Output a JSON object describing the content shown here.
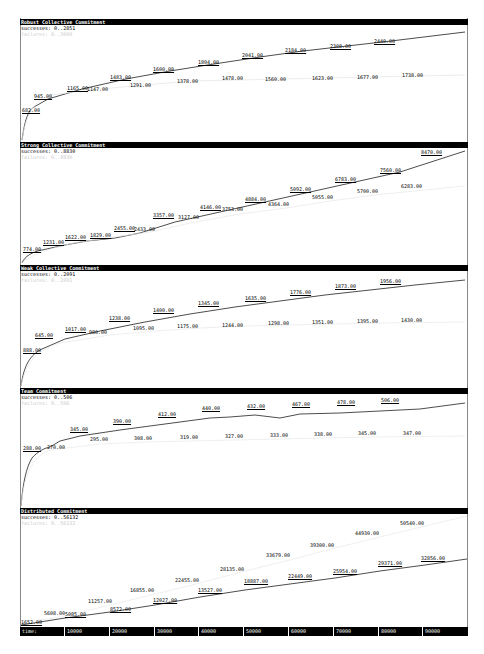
{
  "x_axis": {
    "label": "time:",
    "ticks": [
      "10000",
      "20000",
      "30000",
      "40000",
      "50000",
      "60000",
      "70000",
      "80000",
      "90000"
    ]
  },
  "panels": [
    {
      "title": "Robust Collective Commitment",
      "successes_label": "successes: 0..2851",
      "failures_label": "failures: 0..3000"
    },
    {
      "title": "Strong Collective Commitment",
      "successes_label": "successes: 0..8830",
      "failures_label": "failures: 0..8830"
    },
    {
      "title": "Weak Collective Commitment",
      "successes_label": "successes: 0..2091",
      "failures_label": "failures: 0..2091"
    },
    {
      "title": "Team Commitment",
      "successes_label": "successes: 0..506",
      "failures_label": "failures: 0..506"
    },
    {
      "title": "Distributed Commitment",
      "successes_label": "successes: 0..56132",
      "failures_label": "failures: 0..56132"
    }
  ],
  "chart_data": [
    {
      "type": "line",
      "title": "Robust Collective Commitment",
      "xlabel": "time",
      "ylim": [
        0,
        2851
      ],
      "x": [
        2000,
        6000,
        12000,
        14000,
        20000,
        30000,
        40000,
        50000,
        60000,
        70000,
        80000,
        90000
      ],
      "series": [
        {
          "name": "successes",
          "values_labeled": [
            "682.00",
            "945.00",
            "1165.00",
            "1483.00",
            "1600.00",
            "1804.00",
            "2041.00",
            "2184.00",
            "2308.00",
            "2440.00"
          ],
          "x": [
            2000,
            8000,
            14000,
            22000,
            36000,
            48000,
            57000,
            69000,
            81000,
            93000
          ],
          "values": [
            682,
            945,
            1165,
            1483,
            1600,
            1804,
            2041,
            2184,
            2308,
            2440
          ]
        },
        {
          "name": "failures",
          "x": [
            19000,
            30000,
            44000,
            57000,
            70000,
            83000,
            95000
          ],
          "values": [
            1147,
            1291,
            1378,
            1478,
            1560,
            1623,
            1677,
            1738
          ],
          "values_labeled": [
            "1147.00",
            "1291.00",
            "1378.00",
            "1478.00",
            "1560.00",
            "1623.00",
            "1677.00",
            "1738.00"
          ]
        }
      ]
    },
    {
      "type": "line",
      "title": "Strong Collective Commitment",
      "xlabel": "time",
      "ylim": [
        0,
        8830
      ],
      "series": [
        {
          "name": "successes",
          "values": [
            774,
            1231,
            1622,
            1829,
            2455,
            3357,
            4146,
            4884,
            5092,
            6783,
            7560,
            8470
          ],
          "values_labeled": [
            "774.00",
            "1231.00",
            "1622.00",
            "1829.00",
            "2455.00",
            "3357.00",
            "4146.00",
            "4884.00",
            "5092.00",
            "6783.00",
            "7560.00",
            "8470.00"
          ]
        },
        {
          "name": "failures",
          "values": [
            2433,
            3127,
            3753,
            4364,
            5055,
            5700,
            6283
          ],
          "values_labeled": [
            "2433.00",
            "3127.00",
            "3753.00",
            "4364.00",
            "5055.00",
            "5700.00",
            "6283.00"
          ]
        }
      ]
    },
    {
      "type": "line",
      "title": "Weak Collective Commitment",
      "xlabel": "time",
      "ylim": [
        0,
        2091
      ],
      "series": [
        {
          "name": "successes",
          "values": [
            888,
            645,
            1017,
            1238,
            1400,
            1345,
            1635,
            1776,
            1873,
            1956
          ],
          "values_labeled": [
            "888.00",
            "645.00",
            "1017.00",
            "1238.00",
            "1400.00",
            "1345.00",
            "1635.00",
            "1776.00",
            "1873.00",
            "1956.00"
          ]
        },
        {
          "name": "failures",
          "values": [
            980,
            1095,
            1175,
            1244,
            1298,
            1351,
            1395,
            1430
          ],
          "values_labeled": [
            "980.00",
            "1095.00",
            "1175.00",
            "1244.00",
            "1298.00",
            "1351.00",
            "1395.00",
            "1430.00"
          ]
        }
      ]
    },
    {
      "type": "line",
      "title": "Team Commitment",
      "xlabel": "time",
      "ylim": [
        0,
        506
      ],
      "series": [
        {
          "name": "successes",
          "values": [
            288,
            345,
            390,
            412,
            440,
            432,
            467,
            478,
            506
          ],
          "values_labeled": [
            "288.00",
            "345.00",
            "390.00",
            "412.00",
            "440.00",
            "432.00",
            "467.00",
            "478.00",
            "506.00"
          ]
        },
        {
          "name": "failures",
          "values": [
            270,
            295,
            308,
            319,
            327,
            333,
            338,
            345,
            347
          ],
          "values_labeled": [
            "270.00",
            "295.00",
            "308.00",
            "319.00",
            "327.00",
            "333.00",
            "338.00",
            "345.00",
            "347.00"
          ]
        }
      ]
    },
    {
      "type": "line",
      "title": "Distributed Commitment",
      "xlabel": "time",
      "ylim": [
        0,
        56132
      ],
      "x_ticks": [
        10000,
        20000,
        30000,
        40000,
        50000,
        60000,
        70000,
        80000,
        90000
      ],
      "series": [
        {
          "name": "successes",
          "values": [
            1652,
            5085,
            8572,
            12027,
            13527,
            18887,
            22449,
            25954,
            29371,
            32856
          ],
          "values_labeled": [
            "1652.00",
            "5085.00",
            "8572.00",
            "12027.00",
            "13527.00",
            "18887.00",
            "22449.00",
            "25954.00",
            "29371.00",
            "32856.00"
          ]
        },
        {
          "name": "failures",
          "values": [
            5608,
            11257,
            16855,
            22455,
            28135,
            33679,
            39300,
            44930,
            50540
          ],
          "values_labeled": [
            "5608.00",
            "11257.00",
            "16855.00",
            "22455.00",
            "28135.00",
            "33679.00",
            "39300.00",
            "44930.00",
            "50540.00"
          ]
        }
      ]
    }
  ],
  "labels": {
    "p0": {
      "s": [
        [
          "682.00",
          2,
          88
        ],
        [
          "945.00",
          14,
          74
        ],
        [
          "1165.00",
          47,
          66
        ],
        [
          "1483.00",
          90,
          55
        ],
        [
          "1600.00",
          133,
          47
        ],
        [
          "1804.00",
          178,
          40
        ],
        [
          "2041.00",
          222,
          33
        ],
        [
          "2184.00",
          265,
          28
        ],
        [
          "2308.00",
          310,
          24
        ],
        [
          "2440.00",
          354,
          19
        ]
      ],
      "f": [
        [
          "1147.00",
          67,
          67
        ],
        [
          "1291.00",
          110,
          63
        ],
        [
          "1378.00",
          157,
          59
        ],
        [
          "1478.00",
          202,
          56
        ],
        [
          "1560.00",
          245,
          57
        ],
        [
          "1623.00",
          292,
          56
        ],
        [
          "1677.00",
          337,
          55
        ],
        [
          "1738.00",
          382,
          53
        ]
      ]
    },
    "p1": {
      "s": [
        [
          "774.00",
          3,
          104
        ],
        [
          "1231.00",
          23,
          97
        ],
        [
          "1622.00",
          45,
          92
        ],
        [
          "1829.00",
          70,
          90
        ],
        [
          "2455.00",
          94,
          83
        ],
        [
          "3357.00",
          133,
          70
        ],
        [
          "4146.00",
          180,
          62
        ],
        [
          "4884.00",
          225,
          54
        ],
        [
          "5092.00",
          270,
          44
        ],
        [
          "6783.00",
          315,
          34
        ],
        [
          "7560.00",
          360,
          25
        ],
        [
          "8470.00",
          401,
          7
        ]
      ],
      "f": [
        [
          "2433.00",
          114,
          84
        ],
        [
          "3127.00",
          158,
          72
        ],
        [
          "3753.00",
          202,
          64
        ],
        [
          "4364.00",
          248,
          59
        ],
        [
          "5055.00",
          292,
          52
        ],
        [
          "5700.00",
          337,
          46
        ],
        [
          "6283.00",
          381,
          41
        ]
      ]
    },
    "p2": {
      "s": [
        [
          "888.00",
          3,
          82
        ],
        [
          "645.00",
          15,
          67
        ],
        [
          "1017.00",
          45,
          61
        ],
        [
          "1238.00",
          89,
          50
        ],
        [
          "1400.00",
          133,
          42
        ],
        [
          "1345.00",
          178,
          35
        ],
        [
          "1635.00",
          225,
          30
        ],
        [
          "1776.00",
          270,
          24
        ],
        [
          "1873.00",
          315,
          18
        ],
        [
          "1956.00",
          360,
          13
        ]
      ],
      "f": [
        [
          "980.00",
          69,
          64
        ],
        [
          "1095.00",
          113,
          60
        ],
        [
          "1175.00",
          157,
          58
        ],
        [
          "1244.00",
          202,
          57
        ],
        [
          "1298.00",
          248,
          55
        ],
        [
          "1351.00",
          292,
          54
        ],
        [
          "1395.00",
          337,
          53
        ],
        [
          "1430.00",
          381,
          52
        ]
      ]
    },
    "p3": {
      "s": [
        [
          "288.00",
          3,
          57
        ],
        [
          "345.00",
          50,
          38
        ],
        [
          "390.00",
          93,
          30
        ],
        [
          "412.00",
          138,
          23
        ],
        [
          "440.00",
          182,
          17
        ],
        [
          "432.00",
          227,
          15
        ],
        [
          "467.00",
          272,
          13
        ],
        [
          "478.00",
          317,
          11
        ],
        [
          "506.00",
          361,
          9
        ]
      ],
      "f": [
        [
          "270.00",
          27,
          56
        ],
        [
          "295.00",
          70,
          48
        ],
        [
          "308.00",
          114,
          47
        ],
        [
          "319.00",
          160,
          46
        ],
        [
          "327.00",
          205,
          45
        ],
        [
          "333.00",
          250,
          44
        ],
        [
          "338.00",
          294,
          43
        ],
        [
          "345.00",
          338,
          42
        ],
        [
          "347.00",
          383,
          42
        ]
      ]
    },
    "p4": {
      "s": [
        [
          "1652.00",
          1,
          111
        ],
        [
          "5085.00",
          45,
          103
        ],
        [
          "8572.00",
          90,
          98
        ],
        [
          "12027.00",
          133,
          89
        ],
        [
          "13527.00",
          178,
          79
        ],
        [
          "18887.00",
          224,
          70
        ],
        [
          "22449.00",
          268,
          65
        ],
        [
          "25954.00",
          313,
          60
        ],
        [
          "29371.00",
          358,
          52
        ],
        [
          "32856.00",
          401,
          47
        ]
      ],
      "f": [
        [
          "5608.00",
          24,
          102
        ],
        [
          "11257.00",
          68,
          90
        ],
        [
          "16855.00",
          110,
          79
        ],
        [
          "22455.00",
          155,
          69
        ],
        [
          "28135.00",
          200,
          58
        ],
        [
          "33679.00",
          246,
          44
        ],
        [
          "39300.00",
          290,
          34
        ],
        [
          "44930.00",
          335,
          22
        ],
        [
          "50540.00",
          380,
          12
        ]
      ]
    }
  }
}
